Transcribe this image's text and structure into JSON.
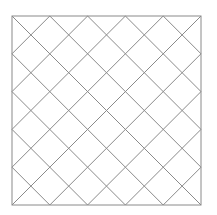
{
  "diagram": {
    "type": "diagonal-lattice",
    "square": {
      "x": 12,
      "y": 16,
      "size": 189
    },
    "divisions": 5,
    "colors": {
      "background": "#ffffff",
      "border": "#8a8a8a",
      "lattice": "#8a8a8a"
    },
    "stroke_width": 1
  }
}
